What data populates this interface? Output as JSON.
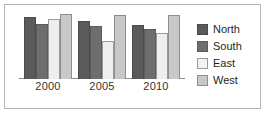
{
  "chart_data": {
    "type": "bar",
    "title": "",
    "subtitle": "",
    "xlabel": "",
    "ylabel": "",
    "categories": [
      "2000",
      "2005",
      "2010"
    ],
    "series": [
      {
        "name": "North",
        "color": "#5a5a5a",
        "values": [
          91,
          85,
          79
        ]
      },
      {
        "name": "South",
        "color": "#6e6e6e",
        "values": [
          81,
          78,
          74
        ]
      },
      {
        "name": "East",
        "color": "#eeeeee",
        "values": [
          88,
          56,
          68
        ]
      },
      {
        "name": "West",
        "color": "#c8c8c8",
        "values": [
          95,
          94,
          94
        ]
      }
    ],
    "ylim": [
      0,
      100
    ],
    "grid": false,
    "legend_position": "right",
    "axis_visible": {
      "x": true,
      "y": false
    },
    "annotations": []
  },
  "legend": {
    "items": [
      {
        "label": "North",
        "swatch": "north-swatch"
      },
      {
        "label": "South",
        "swatch": "south-swatch"
      },
      {
        "label": "East",
        "swatch": "east-swatch"
      },
      {
        "label": "West",
        "swatch": "west-swatch"
      }
    ]
  },
  "axis": {
    "x_ticks": [
      "2000",
      "2005",
      "2010"
    ]
  },
  "style": {
    "frame_color": "#b4b4b4",
    "baseline_color": "#8c8c8c",
    "background": "#ffffff"
  }
}
